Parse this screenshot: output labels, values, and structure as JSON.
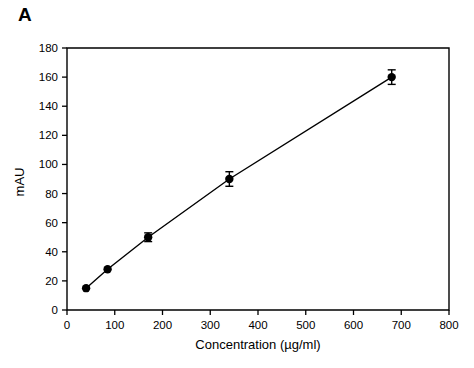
{
  "figure": {
    "panel_label": "A",
    "background_color": "#ffffff",
    "foreground_color": "#000000"
  },
  "chart_data": {
    "type": "line",
    "title": "",
    "subtitle": "",
    "xlabel": "Concentration (µg/ml)",
    "ylabel": "mAU",
    "xlim": [
      0,
      800
    ],
    "ylim": [
      0,
      180
    ],
    "xticks": [
      0,
      100,
      200,
      300,
      400,
      500,
      600,
      700,
      800
    ],
    "yticks": [
      0,
      20,
      40,
      60,
      80,
      100,
      120,
      140,
      160,
      180
    ],
    "xtick_labels": [
      "0",
      "100",
      "200",
      "300",
      "400",
      "500",
      "600",
      "700",
      "800"
    ],
    "ytick_labels": [
      "0",
      "20",
      "40",
      "60",
      "80",
      "100",
      "120",
      "140",
      "160",
      "180"
    ],
    "grid": false,
    "legend": null,
    "legend_position": "none",
    "marker": "filled-circle",
    "marker_color": "#000000",
    "line_color": "#000000",
    "series": [
      {
        "name": "standard curve",
        "x": [
          40,
          85,
          170,
          340,
          680
        ],
        "values": [
          15,
          28,
          50,
          90,
          160
        ],
        "yerr": [
          0,
          0,
          3,
          5,
          5
        ]
      }
    ],
    "annotations": []
  }
}
